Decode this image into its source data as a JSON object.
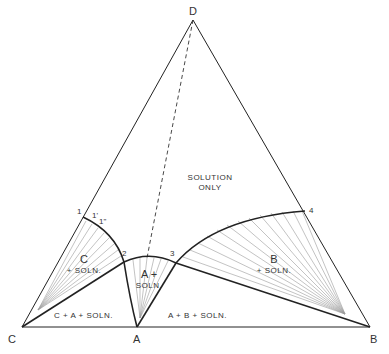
{
  "diagram": {
    "type": "ternary-phase-diagram",
    "vertices": {
      "top": "D",
      "left": "C",
      "bottom_middle": "A",
      "right": "B"
    },
    "points": [
      "1",
      "1'",
      "1\"",
      "2",
      "3",
      "4"
    ],
    "regions": {
      "solution_only_line1": "SOLUTION",
      "solution_only_line2": "ONLY",
      "c_solid_line1": "C",
      "c_solid_line2": "+ SOLN.",
      "a_solid_line1": "A +",
      "a_solid_line2": "SOLN.",
      "b_solid_line1": "B",
      "b_solid_line2": "+ SOLN.",
      "c_a_three_phase": "C + A + SOLN.",
      "a_b_three_phase": "A + B + SOLN."
    },
    "colors": {
      "line": "#222222",
      "tie_line": "#9a9a9a",
      "text": "#333333"
    }
  }
}
